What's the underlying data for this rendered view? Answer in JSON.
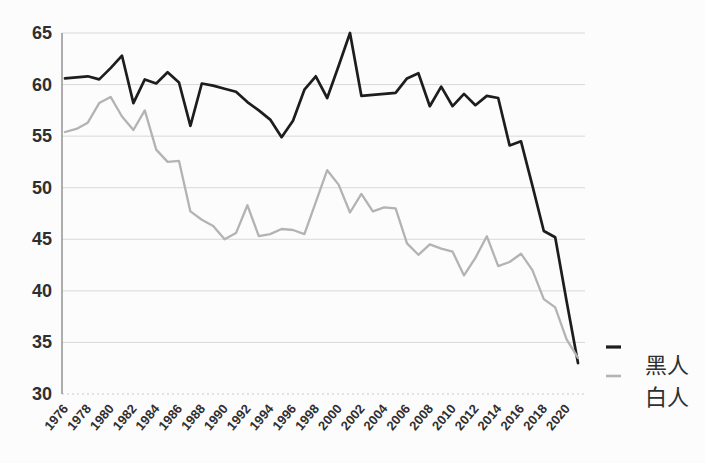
{
  "page": {
    "background": "#fcfcfc"
  },
  "chart_data": {
    "type": "line",
    "title": "",
    "xlabel": "",
    "ylabel": "",
    "x": [
      1976,
      1977,
      1978,
      1979,
      1980,
      1981,
      1982,
      1983,
      1984,
      1985,
      1986,
      1987,
      1988,
      1989,
      1990,
      1991,
      1992,
      1993,
      1994,
      1995,
      1996,
      1997,
      1998,
      1999,
      2000,
      2001,
      2002,
      2003,
      2004,
      2005,
      2006,
      2007,
      2008,
      2009,
      2010,
      2011,
      2012,
      2013,
      2014,
      2015,
      2016,
      2017,
      2018,
      2019,
      2020,
      2021
    ],
    "xtick_labels": [
      "1976",
      "1978",
      "1980",
      "1982",
      "1984",
      "1986",
      "1988",
      "1990",
      "1992",
      "1994",
      "1996",
      "1998",
      "2000",
      "2002",
      "2004",
      "2006",
      "2008",
      "2010",
      "2012",
      "2014",
      "2016",
      "2018",
      "2020"
    ],
    "yticks": [
      30,
      35,
      40,
      45,
      50,
      55,
      60,
      65
    ],
    "ylim": [
      30,
      65
    ],
    "grid": true,
    "legend_position": "right",
    "axis_color": "#8c8c8c",
    "grid_color": "#d9d9d9",
    "baseline_color": "#c8c8c8",
    "label_color": "#2f2f2f",
    "series": [
      {
        "name": "黑人",
        "color": "#1d1d1d",
        "width": 2.7,
        "values": [
          60.6,
          60.7,
          60.8,
          60.5,
          61.6,
          62.8,
          58.2,
          60.5,
          60.1,
          61.2,
          60.2,
          56.0,
          60.1,
          59.9,
          59.6,
          59.3,
          58.3,
          57.5,
          56.6,
          54.9,
          56.5,
          59.5,
          60.8,
          58.7,
          61.8,
          65.0,
          58.9,
          59.0,
          59.1,
          59.2,
          60.6,
          61.1,
          57.9,
          59.8,
          57.9,
          59.1,
          58.0,
          58.9,
          58.7,
          54.1,
          54.5,
          50.2,
          45.8,
          45.2,
          39.0,
          33.0
        ]
      },
      {
        "name": "白人",
        "color": "#b3b3b3",
        "width": 2.3,
        "values": [
          55.4,
          55.7,
          56.3,
          58.2,
          58.8,
          56.9,
          55.6,
          57.5,
          53.7,
          52.5,
          52.6,
          47.7,
          46.9,
          46.3,
          45.0,
          45.6,
          48.3,
          45.3,
          45.5,
          46.0,
          45.9,
          45.5,
          48.6,
          51.7,
          50.3,
          47.6,
          49.4,
          47.7,
          48.1,
          48.0,
          44.6,
          43.5,
          44.5,
          44.1,
          43.8,
          41.5,
          43.2,
          45.3,
          42.4,
          42.8,
          43.6,
          42.0,
          39.2,
          38.4,
          35.3,
          33.5
        ]
      }
    ]
  },
  "legend": {
    "items": [
      {
        "label": "黑人",
        "color": "#1d1d1d"
      },
      {
        "label": "白人",
        "color": "#b3b3b3"
      }
    ]
  }
}
